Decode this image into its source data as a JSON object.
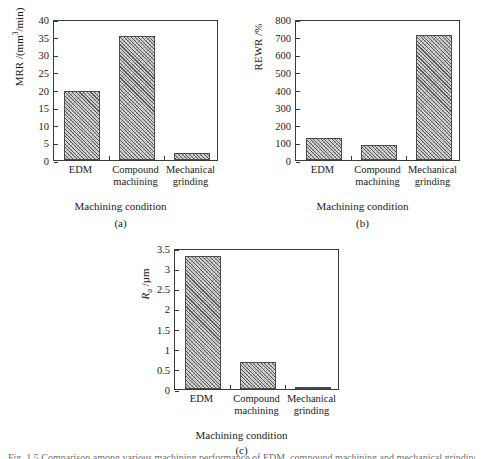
{
  "figure": {
    "caption": "Fig. 1.5   Comparison among various machining performance of EDM, compound machining and mechanical grinding"
  },
  "panels": [
    {
      "id": "a",
      "subcaption": "(a)",
      "xlabel": "Machining condition",
      "ylabel_prefix": "MRR /(mm",
      "ylabel_sup": "3",
      "ylabel_suffix": "/min)",
      "yticks": [
        "0",
        "5",
        "10",
        "15",
        "20",
        "25",
        "30",
        "35",
        "40"
      ],
      "categories": [
        {
          "line1": "EDM",
          "line2": ""
        },
        {
          "line1": "Compound",
          "line2": "machining"
        },
        {
          "line1": "Mechanical",
          "line2": "grinding"
        }
      ]
    },
    {
      "id": "b",
      "subcaption": "(b)",
      "xlabel": "Machining condition",
      "ylabel_prefix": "REWR /%",
      "ylabel_sup": "",
      "ylabel_suffix": "",
      "yticks": [
        "0",
        "100",
        "200",
        "300",
        "400",
        "500",
        "600",
        "700",
        "800"
      ],
      "categories": [
        {
          "line1": "EDM",
          "line2": ""
        },
        {
          "line1": "Compound",
          "line2": "machining"
        },
        {
          "line1": "Mechanical",
          "line2": "grinding"
        }
      ]
    },
    {
      "id": "c",
      "subcaption": "(c)",
      "xlabel": "Machining condition",
      "ylabel_prefix": "R",
      "ylabel_sub": "a",
      "ylabel_suffix": " /µm",
      "yticks": [
        "0",
        "0.5",
        "1",
        "1.5",
        "2",
        "2.5",
        "3",
        "3.5"
      ],
      "categories": [
        {
          "line1": "EDM",
          "line2": ""
        },
        {
          "line1": "Compound",
          "line2": "machining"
        },
        {
          "line1": "Mechanical",
          "line2": "grinding"
        }
      ]
    }
  ],
  "chart_data": [
    {
      "type": "bar",
      "panel": "a",
      "title": "",
      "categories": [
        "EDM",
        "Compound machining",
        "Mechanical grinding"
      ],
      "values": [
        19.5,
        35.1,
        2.0
      ],
      "xlabel": "Machining condition",
      "ylabel": "MRR /(mm3/min)",
      "ylim": [
        0,
        40
      ],
      "ytick_step": 5,
      "grid": false,
      "legend": "none",
      "bar_fill": "#d4d4d4",
      "bar_hatch": "cross-diagonal",
      "bar_edge": "#4a4a4a"
    },
    {
      "type": "bar",
      "panel": "b",
      "title": "",
      "categories": [
        "EDM",
        "Compound machining",
        "Mechanical grinding"
      ],
      "values": [
        126,
        85,
        710
      ],
      "xlabel": "Machining condition",
      "ylabel": "REWR /%",
      "ylim": [
        0,
        800
      ],
      "ytick_step": 100,
      "grid": false,
      "legend": "none",
      "bar_fill": "#d4d4d4",
      "bar_hatch": "cross-diagonal",
      "bar_edge": "#4a4a4a"
    },
    {
      "type": "bar",
      "panel": "c",
      "title": "",
      "categories": [
        "EDM",
        "Compound machining",
        "Mechanical grinding"
      ],
      "values": [
        3.3,
        0.67,
        0.05
      ],
      "xlabel": "Machining condition",
      "ylabel": "Ra /µm",
      "ylim": [
        0,
        3.5
      ],
      "ytick_step": 0.5,
      "grid": false,
      "legend": "none",
      "bar_fill": "#d4d4d4",
      "bar_hatch": "cross-diagonal",
      "bar_edge": "#4a4a4a"
    }
  ]
}
